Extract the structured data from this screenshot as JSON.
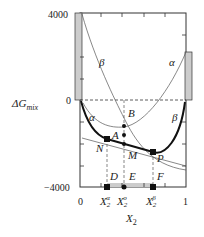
{
  "diagram": {
    "y_axis_label": "ΔG",
    "y_axis_label_sub": "mix",
    "x_axis_label": "X",
    "x_axis_label_sub": "2",
    "y_ticks": {
      "top": "4000",
      "zero": "0",
      "bottom": "−4000"
    },
    "x_ticks": {
      "left": "0",
      "right": "1"
    },
    "x_markers": [
      {
        "base": "X",
        "sub": "2",
        "sup": "α"
      },
      {
        "base": "X",
        "sub": "2",
        "sup": "o"
      },
      {
        "base": "X",
        "sub": "2",
        "sup": "β"
      }
    ],
    "curve_labels": {
      "beta_upper": "β",
      "alpha_upper": "α",
      "alpha_lower": "α",
      "beta_lower": "β"
    },
    "points": {
      "A": "A",
      "B": "B",
      "M": "M",
      "N": "N",
      "P": "P",
      "D": "D",
      "E": "E",
      "F": "F"
    },
    "colors": {
      "line": "#222222",
      "thin": "#555555",
      "fill": "#cccccc"
    }
  }
}
